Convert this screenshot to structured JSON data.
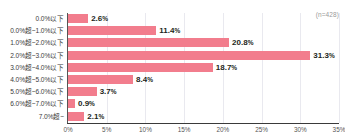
{
  "title_faint": "",
  "sample_note": "(n=428)",
  "chart_data": {
    "type": "bar",
    "orientation": "horizontal",
    "title": "",
    "xlabel": "",
    "ylabel": "",
    "xlim": [
      0,
      35
    ],
    "grid": true,
    "legend": "none",
    "bar_color": "#f27d8d",
    "axis_color": "#3a3a3a",
    "gridline_color": "#e9e9ef",
    "categories": [
      "0.0%以下",
      "0.0%超~1.0%以下",
      "1.0%超~2.0%以下",
      "2.0%超~3.0%以下",
      "3.0%超~4.0%以下",
      "4.0%超~5.0%以下",
      "5.0%超~6.0%以下",
      "6.0%超~7.0%以下",
      "7.0%超~"
    ],
    "values": [
      2.6,
      11.4,
      20.8,
      31.3,
      18.7,
      8.4,
      3.7,
      0.9,
      2.1
    ],
    "value_labels": [
      "2.6%",
      "11.4%",
      "20.8%",
      "31.3%",
      "18.7%",
      "8.4%",
      "3.7%",
      "0.9%",
      "2.1%"
    ],
    "xticks": [
      0,
      5,
      10,
      15,
      20,
      25,
      30,
      35
    ],
    "xtick_labels": [
      "0%",
      "5%",
      "10%",
      "15%",
      "20%",
      "25%",
      "30%",
      "35%"
    ]
  }
}
